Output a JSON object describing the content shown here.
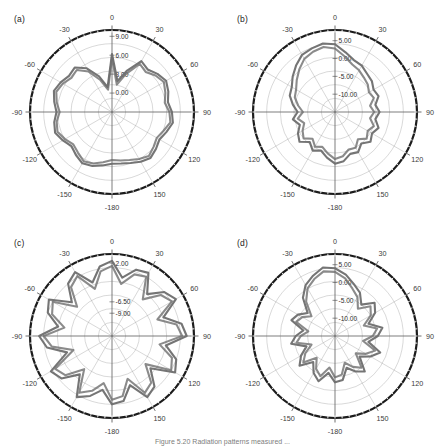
{
  "figure": {
    "caption_partial": "Figure 5.20  Radiation patterns measured ...",
    "angular_ticks": [
      "0",
      "30",
      "60",
      "90",
      "120",
      "150",
      "-180",
      "-150",
      "-120",
      "-90",
      "-60",
      "-30"
    ],
    "angular_tick_values": [
      0,
      30,
      60,
      90,
      120,
      150,
      180,
      -150,
      -120,
      -90,
      -60,
      -30
    ],
    "line_color": "#6e6e6e",
    "grid_color": "#9a9a9a",
    "rim_color": "#1c1c1c",
    "background": "#ffffff"
  },
  "panels": [
    {
      "id": "a",
      "label": "(a)",
      "radial_labels": [
        "9.00",
        "6.00",
        "3.00",
        "0.00"
      ],
      "radial_values": [
        9.0,
        6.0,
        3.0,
        0.0
      ]
    },
    {
      "id": "b",
      "label": "(b)",
      "radial_labels": [
        "5.00",
        "0.00",
        "-5.00",
        "-10.00"
      ],
      "radial_values": [
        5.0,
        0.0,
        -5.0,
        -10.0
      ]
    },
    {
      "id": "c",
      "label": "(c)",
      "radial_labels": [
        "2.00",
        "-6.50",
        "-9.00"
      ],
      "radial_values": [
        2.0,
        -6.5,
        -9.0
      ]
    },
    {
      "id": "d",
      "label": "(d)",
      "radial_labels": [
        "5.00",
        "0.00",
        "-5.00",
        "-10.00"
      ],
      "radial_values": [
        5.0,
        0.0,
        -5.0,
        -10.0
      ]
    }
  ],
  "chart_data": [
    {
      "type": "line",
      "subtype": "polar",
      "panel": "a",
      "title": "(a)",
      "xlabel": "Angle (degrees)",
      "ylabel": "Gain (dB)",
      "theta_unit": "degrees",
      "theta_range": [
        -180,
        180
      ],
      "theta_tick_step": 30,
      "rlim": [
        -3.0,
        10.0
      ],
      "r_ticks": [
        0.0,
        3.0,
        6.0,
        9.0
      ],
      "r_tick_labels": [
        "0.00",
        "3.00",
        "6.00",
        "9.00"
      ],
      "grid": true,
      "legend": "none",
      "series": [
        {
          "name": "pattern-1",
          "theta": [
            -180,
            -170,
            -160,
            -150,
            -140,
            -130,
            -120,
            -110,
            -100,
            -90,
            -80,
            -70,
            -60,
            -50,
            -40,
            -30,
            -20,
            -10,
            0,
            10,
            20,
            30,
            40,
            50,
            60,
            70,
            80,
            90,
            100,
            110,
            120,
            130,
            140,
            150,
            160,
            170,
            180
          ],
          "r": [
            5.2,
            5.6,
            6.1,
            6.4,
            5.9,
            5.4,
            6.0,
            6.6,
            6.3,
            5.8,
            6.3,
            6.8,
            6.4,
            5.9,
            6.2,
            5.0,
            3.0,
            1.0,
            6.2,
            2.0,
            4.0,
            6.3,
            5.8,
            6.4,
            6.9,
            6.5,
            6.0,
            6.5,
            6.8,
            6.2,
            5.7,
            6.1,
            6.5,
            6.1,
            5.6,
            5.3,
            5.2
          ]
        },
        {
          "name": "pattern-2",
          "theta": [
            -180,
            -170,
            -160,
            -150,
            -140,
            -130,
            -120,
            -110,
            -100,
            -90,
            -80,
            -70,
            -60,
            -50,
            -40,
            -30,
            -20,
            -10,
            0,
            10,
            20,
            30,
            40,
            50,
            60,
            70,
            80,
            90,
            100,
            110,
            120,
            130,
            140,
            150,
            160,
            170,
            180
          ],
          "r": [
            4.6,
            5.1,
            5.7,
            6.0,
            5.4,
            5.0,
            5.6,
            6.2,
            5.9,
            5.3,
            5.9,
            6.4,
            6.0,
            5.4,
            5.7,
            4.4,
            2.4,
            0.6,
            5.6,
            1.4,
            3.4,
            5.8,
            5.3,
            6.0,
            6.5,
            6.0,
            5.5,
            6.1,
            6.4,
            5.7,
            5.2,
            5.6,
            6.1,
            5.6,
            5.1,
            4.8,
            4.6
          ]
        }
      ]
    },
    {
      "type": "line",
      "subtype": "polar",
      "panel": "b",
      "title": "(b)",
      "xlabel": "Angle (degrees)",
      "ylabel": "Gain (dB)",
      "theta_unit": "degrees",
      "theta_range": [
        -180,
        180
      ],
      "theta_tick_step": 30,
      "rlim": [
        -15.0,
        8.0
      ],
      "r_ticks": [
        -10.0,
        -5.0,
        0.0,
        5.0
      ],
      "r_tick_labels": [
        "-10.00",
        "-5.00",
        "0.00",
        "5.00"
      ],
      "grid": true,
      "legend": "none",
      "series": [
        {
          "name": "pattern-1",
          "theta": [
            -180,
            -170,
            -160,
            -150,
            -140,
            -130,
            -120,
            -110,
            -100,
            -90,
            -80,
            -70,
            -60,
            -50,
            -40,
            -30,
            -20,
            -10,
            0,
            10,
            20,
            30,
            40,
            50,
            60,
            70,
            80,
            90,
            100,
            110,
            120,
            130,
            140,
            150,
            160,
            170,
            180
          ],
          "r": [
            -0.5,
            -2.0,
            -3.5,
            -2.5,
            -4.0,
            -2.0,
            -3.0,
            -4.5,
            -3.0,
            -4.5,
            -3.0,
            -1.5,
            -1.0,
            0.5,
            2.0,
            3.5,
            4.0,
            4.5,
            4.0,
            2.0,
            0.5,
            0.0,
            -1.0,
            -1.5,
            -2.5,
            -2.0,
            -3.5,
            -2.5,
            -3.5,
            -2.0,
            -3.0,
            -2.0,
            -3.5,
            -2.0,
            -2.5,
            -1.0,
            -0.5
          ]
        },
        {
          "name": "pattern-2",
          "theta": [
            -180,
            -170,
            -160,
            -150,
            -140,
            -130,
            -120,
            -110,
            -100,
            -90,
            -80,
            -70,
            -60,
            -50,
            -40,
            -30,
            -20,
            -10,
            0,
            10,
            20,
            30,
            40,
            50,
            60,
            70,
            80,
            90,
            100,
            110,
            120,
            130,
            140,
            150,
            160,
            170,
            180
          ],
          "r": [
            -1.8,
            -3.2,
            -4.6,
            -3.8,
            -5.2,
            -3.5,
            -4.5,
            -5.8,
            -4.4,
            -6.0,
            -4.5,
            -3.0,
            -2.4,
            -1.0,
            0.6,
            2.2,
            3.0,
            3.5,
            2.8,
            0.8,
            -0.8,
            -1.5,
            -2.4,
            -3.0,
            -4.0,
            -3.4,
            -5.0,
            -4.0,
            -5.0,
            -3.4,
            -4.4,
            -3.4,
            -5.0,
            -3.4,
            -3.8,
            -2.4,
            -1.8
          ]
        }
      ]
    },
    {
      "type": "line",
      "subtype": "polar",
      "panel": "c",
      "title": "(c)",
      "xlabel": "Angle (degrees)",
      "ylabel": "Gain (dB)",
      "theta_unit": "degrees",
      "theta_range": [
        -180,
        180
      ],
      "theta_tick_step": 30,
      "rlim": [
        -14.0,
        4.0
      ],
      "r_ticks": [
        -9.0,
        -6.5,
        2.0
      ],
      "r_tick_labels": [
        "-9.00",
        "-6.50",
        "2.00"
      ],
      "grid": true,
      "legend": "none",
      "series": [
        {
          "name": "pattern-1",
          "theta": [
            -180,
            -170,
            -160,
            -150,
            -140,
            -130,
            -120,
            -110,
            -100,
            -90,
            -80,
            -70,
            -60,
            -50,
            -40,
            -30,
            -20,
            -10,
            0,
            10,
            20,
            30,
            40,
            50,
            60,
            70,
            80,
            90,
            100,
            110,
            120,
            130,
            140,
            150,
            160,
            170,
            180
          ],
          "r": [
            1.0,
            -2.0,
            0.0,
            1.5,
            -3.0,
            0.5,
            1.5,
            -3.5,
            0.5,
            2.0,
            -2.0,
            1.0,
            2.0,
            -2.5,
            1.0,
            2.2,
            -1.5,
            1.5,
            2.5,
            -1.0,
            1.5,
            2.0,
            -2.0,
            1.0,
            2.2,
            -2.0,
            1.5,
            2.4,
            -2.0,
            1.0,
            2.0,
            -3.0,
            0.5,
            1.5,
            -2.5,
            0.5,
            1.0
          ]
        },
        {
          "name": "pattern-2",
          "theta": [
            -180,
            -170,
            -160,
            -150,
            -140,
            -130,
            -120,
            -110,
            -100,
            -90,
            -80,
            -70,
            -60,
            -50,
            -40,
            -30,
            -20,
            -10,
            0,
            10,
            20,
            30,
            40,
            50,
            60,
            70,
            80,
            90,
            100,
            110,
            120,
            130,
            140,
            150,
            160,
            170,
            180
          ],
          "r": [
            0.0,
            -3.5,
            -1.2,
            0.4,
            -4.5,
            -0.6,
            0.4,
            -5.0,
            -0.6,
            1.0,
            -3.4,
            0.0,
            1.0,
            -4.0,
            0.0,
            1.2,
            -3.0,
            0.4,
            1.4,
            -2.4,
            0.4,
            1.0,
            -3.5,
            0.0,
            1.2,
            -3.4,
            0.4,
            1.4,
            -3.4,
            0.0,
            1.0,
            -4.4,
            -0.6,
            0.4,
            -4.0,
            -0.6,
            0.0
          ]
        }
      ]
    },
    {
      "type": "line",
      "subtype": "polar",
      "panel": "d",
      "title": "(d)",
      "xlabel": "Angle (degrees)",
      "ylabel": "Gain (dB)",
      "theta_unit": "degrees",
      "theta_range": [
        -180,
        180
      ],
      "theta_tick_step": 30,
      "rlim": [
        -15.0,
        8.0
      ],
      "r_ticks": [
        -10.0,
        -5.0,
        0.0,
        5.0
      ],
      "r_tick_labels": [
        "-10.00",
        "-5.00",
        "0.00",
        "5.00"
      ],
      "grid": true,
      "legend": "none",
      "series": [
        {
          "name": "pattern-1",
          "theta": [
            -180,
            -170,
            -160,
            -150,
            -140,
            -130,
            -120,
            -110,
            -100,
            -90,
            -80,
            -70,
            -60,
            -50,
            -40,
            -30,
            -20,
            -10,
            0,
            10,
            20,
            30,
            40,
            50,
            60,
            70,
            80,
            90,
            100,
            110,
            120,
            130,
            140,
            150,
            160,
            170,
            180
          ],
          "r": [
            -2.0,
            -4.5,
            -1.5,
            -3.0,
            -5.5,
            -2.0,
            -4.0,
            -6.5,
            -2.5,
            -4.0,
            -6.0,
            -2.0,
            -3.0,
            -5.0,
            -1.0,
            1.5,
            3.0,
            4.5,
            4.0,
            2.5,
            0.5,
            -1.0,
            -3.5,
            -0.5,
            -2.0,
            -5.0,
            -1.5,
            -3.0,
            -5.5,
            -1.5,
            -3.5,
            -6.0,
            -2.0,
            -3.5,
            -5.5,
            -2.5,
            -2.0
          ]
        },
        {
          "name": "pattern-2",
          "theta": [
            -180,
            -170,
            -160,
            -150,
            -140,
            -130,
            -120,
            -110,
            -100,
            -90,
            -80,
            -70,
            -60,
            -50,
            -40,
            -30,
            -20,
            -10,
            0,
            10,
            20,
            30,
            40,
            50,
            60,
            70,
            80,
            90,
            100,
            110,
            120,
            130,
            140,
            150,
            160,
            170,
            180
          ],
          "r": [
            -3.4,
            -6.0,
            -3.0,
            -4.4,
            -7.0,
            -3.4,
            -5.4,
            -8.0,
            -4.0,
            -5.4,
            -7.4,
            -3.4,
            -4.4,
            -6.4,
            -2.4,
            0.4,
            2.0,
            3.4,
            3.0,
            1.4,
            -0.8,
            -2.4,
            -5.0,
            -2.0,
            -3.4,
            -6.4,
            -3.0,
            -4.4,
            -7.0,
            -3.0,
            -5.0,
            -7.4,
            -3.4,
            -5.0,
            -7.0,
            -4.0,
            -3.4
          ]
        }
      ]
    }
  ]
}
